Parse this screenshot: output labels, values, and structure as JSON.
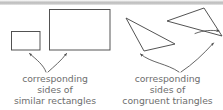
{
  "figure": {
    "background_color": "#ffffff",
    "stroke_color": "#4a4a4a",
    "text_color": "#6e6e6e",
    "top_band_color": "#bdbdbd",
    "width": 223,
    "height": 110
  },
  "shapes": {
    "small_rectangle": {
      "name": "small similar rectangle",
      "x": 11,
      "y": 31,
      "width": 29,
      "height": 19
    },
    "large_rectangle": {
      "name": "large similar rectangle",
      "x": 49,
      "y": 9,
      "width": 61,
      "height": 41
    },
    "left_triangle": {
      "name": "left congruent triangle",
      "points": "126,18 175,44 144,51"
    },
    "right_triangle": {
      "name": "right congruent triangle",
      "points": "167,21 204,8 222,36"
    }
  },
  "arrows": {
    "left_group": [
      {
        "name": "arrow-to-small-rectangle",
        "path": "M 46,72 C 42,66 36,61 28,54",
        "tip": "28,52"
      },
      {
        "name": "arrow-to-large-rectangle",
        "path": "M 48,72 C 54,66 62,60 67,54",
        "tip": "68,52"
      }
    ],
    "right_group": [
      {
        "name": "arrow-to-left-triangle",
        "path": "M 178,72 C 168,64 152,62 140,54",
        "tip": "137,50"
      },
      {
        "name": "arrow-to-right-triangle",
        "path": "M 180,72 C 192,64 203,54 214,42",
        "tip": "216,39"
      },
      {
        "name": "arrow-to-right-triangle-edge",
        "path": "M 196,33 C 205,30 212,30 219,31",
        "tip": "222,31"
      }
    ]
  },
  "captions": {
    "left": {
      "lines": [
        "corresponding",
        "sides of",
        "similar rectangles"
      ],
      "line1": "corresponding",
      "line2": "sides of",
      "line3": "similar rectangles"
    },
    "right": {
      "lines": [
        "corresponding",
        "sides of",
        "congruent triangles"
      ],
      "line1": "corresponding",
      "line2": "sides of",
      "line3": "congruent triangles"
    }
  }
}
